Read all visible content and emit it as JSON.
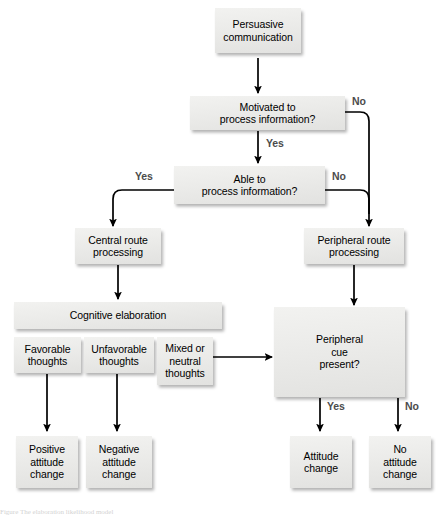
{
  "diagram": {
    "type": "flowchart",
    "background_color": "#ffffff",
    "node_fill_color": "#ebebe9",
    "edge_color": "#000000",
    "edge_label_color": "#4c4c4c",
    "nodes": [
      {
        "id": "persuasive_communication",
        "label": "Persuasive\ncommunication"
      },
      {
        "id": "motivated",
        "label": "Motivated to\nprocess information?"
      },
      {
        "id": "able",
        "label": "Able to\nprocess information?"
      },
      {
        "id": "central_route",
        "label": "Central route\nprocessing"
      },
      {
        "id": "peripheral_route",
        "label": "Peripheral route\nprocessing"
      },
      {
        "id": "cognitive_elaboration",
        "label": "Cognitive elaboration"
      },
      {
        "id": "favorable",
        "label": "Favorable\nthoughts"
      },
      {
        "id": "unfavorable",
        "label": "Unfavorable\nthoughts"
      },
      {
        "id": "mixed",
        "label": "Mixed or\nneutral\nthoughts"
      },
      {
        "id": "peripheral_cue",
        "label": "Peripheral\ncue\npresent?"
      },
      {
        "id": "positive_change",
        "label": "Positive\nattitude\nchange"
      },
      {
        "id": "negative_change",
        "label": "Negative\nattitude\nchange"
      },
      {
        "id": "attitude_change",
        "label": "Attitude\nchange"
      },
      {
        "id": "no_attitude_change",
        "label": "No\nattitude\nchange"
      }
    ],
    "edge_labels": {
      "motivated_no": "No",
      "motivated_yes": "Yes",
      "able_yes": "Yes",
      "able_no": "No",
      "cue_yes": "Yes",
      "cue_no": "No"
    },
    "caption": "Figure  The elaboration likelihood model"
  }
}
